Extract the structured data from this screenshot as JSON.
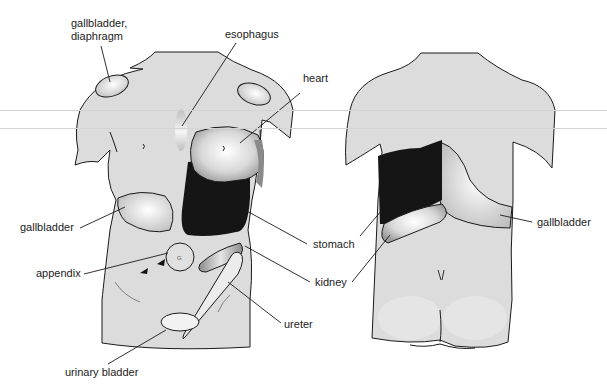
{
  "figure": {
    "views": [
      "anterior",
      "posterior"
    ],
    "colors": {
      "skin": "#dcdcdc",
      "outline": "#1a1a1a",
      "organ_dark": "#151515",
      "organ_light": "#f4f4f4",
      "band": "#d4d4d4"
    }
  },
  "labels": {
    "front": {
      "gallbladder_diaphragm": [
        "gallbladder,",
        "diaphragm"
      ],
      "esophagus": "esophagus",
      "heart": "heart",
      "gallbladder": "gallbladder",
      "appendix": "appendix",
      "stomach": "stomach",
      "kidney": "kidney",
      "ureter": "ureter",
      "urinary_bladder": "urinary bladder"
    },
    "back": {
      "gallbladder": "gallbladder"
    }
  }
}
